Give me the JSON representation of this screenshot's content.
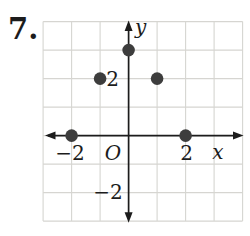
{
  "problem_number": "7.",
  "colors": {
    "background": "#ffffff",
    "grid": "#d6d5d1",
    "axis": "#1c1c1c",
    "label": "#1c1c1c",
    "point": "#3d3d3d"
  },
  "chart_data": {
    "type": "scatter",
    "title": "",
    "xlabel": "x",
    "ylabel": "y",
    "origin_label": "O",
    "xlim": [
      -3,
      4
    ],
    "ylim": [
      -3,
      4
    ],
    "grid": true,
    "legend": false,
    "points": [
      [
        -2,
        0
      ],
      [
        -1,
        2
      ],
      [
        0,
        3
      ],
      [
        1,
        2
      ],
      [
        2,
        0
      ]
    ],
    "x_tick_labels": [
      {
        "value": -2,
        "label": "−2"
      },
      {
        "value": 2,
        "label": "2"
      }
    ],
    "y_tick_labels": [
      {
        "value": 2,
        "label": "2"
      },
      {
        "value": -2,
        "label": "−2"
      }
    ]
  }
}
